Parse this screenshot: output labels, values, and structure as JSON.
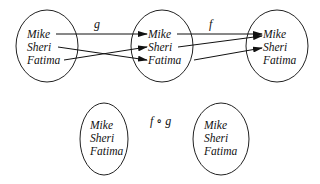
{
  "diagram": {
    "type": "function-mapping",
    "top_sets": [
      {
        "id": "A",
        "elements": [
          "Mike",
          "Sheri",
          "Fatima"
        ]
      },
      {
        "id": "B",
        "elements": [
          "Mike",
          "Sheri",
          "Fatima"
        ]
      },
      {
        "id": "C",
        "elements": [
          "Mike",
          "Sheri",
          "Fatima"
        ]
      }
    ],
    "functions": [
      {
        "name": "g",
        "from": "A",
        "to": "B",
        "mapping": [
          [
            "Mike",
            "Mike"
          ],
          [
            "Sheri",
            "Fatima"
          ],
          [
            "Fatima",
            "Sheri"
          ]
        ]
      },
      {
        "name": "f",
        "from": "B",
        "to": "C",
        "mapping": [
          [
            "Mike",
            "Mike"
          ],
          [
            "Sheri",
            "Mike"
          ],
          [
            "Fatima",
            "Sheri"
          ]
        ]
      }
    ],
    "bottom_sets": [
      {
        "id": "A",
        "elements": [
          "Mike",
          "Sheri",
          "Fatima"
        ]
      },
      {
        "id": "C",
        "elements": [
          "Mike",
          "Sheri",
          "Fatima"
        ]
      }
    ],
    "composition_label": "f ∘ g"
  }
}
